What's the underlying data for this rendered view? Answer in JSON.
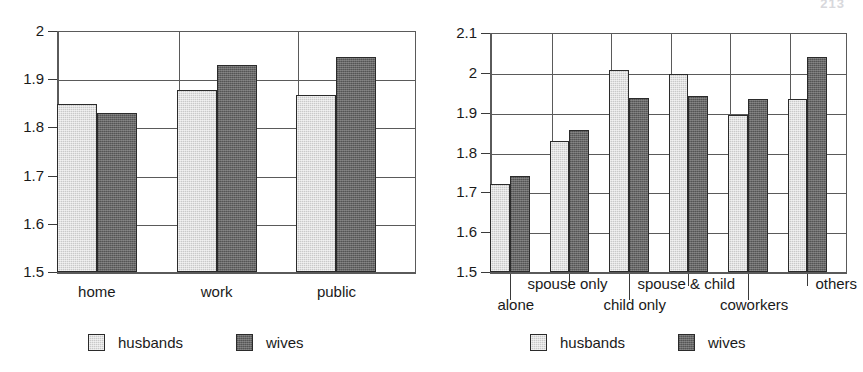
{
  "page": {
    "header_artifact": "213",
    "background_color": "#ffffff"
  },
  "colors": {
    "husbands": "#c9c9c9",
    "wives": "#676767",
    "axis": "#5a5a5a",
    "text": "#1a1a1a"
  },
  "legend": {
    "husbands_label": "husbands",
    "wives_label": "wives"
  },
  "chart_data": [
    {
      "id": "left",
      "type": "bar",
      "title": "",
      "xlabel": "",
      "ylabel": "",
      "ylim": [
        1.5,
        2.0
      ],
      "yticks": [
        "1.5",
        "1.6",
        "1.7",
        "1.8",
        "1.9",
        "2"
      ],
      "ytick_values": [
        1.5,
        1.6,
        1.7,
        1.8,
        1.9,
        2.0
      ],
      "grid": true,
      "legend_position": "bottom",
      "categories": [
        "home",
        "work",
        "public"
      ],
      "series": [
        {
          "name": "husbands",
          "values": [
            1.848,
            1.878,
            1.868
          ]
        },
        {
          "name": "wives",
          "values": [
            1.829,
            1.929,
            1.946
          ]
        }
      ]
    },
    {
      "id": "right",
      "type": "bar",
      "title": "",
      "xlabel": "",
      "ylabel": "",
      "ylim": [
        1.5,
        2.1
      ],
      "yticks": [
        "1.5",
        "1.6",
        "1.7",
        "1.8",
        "1.9",
        "2",
        "2.1"
      ],
      "ytick_values": [
        1.5,
        1.6,
        1.7,
        1.8,
        1.9,
        2.0,
        2.1
      ],
      "grid": true,
      "legend_position": "bottom",
      "categories": [
        "alone",
        "spouse only",
        "child only",
        "spouse & child",
        "coworkers",
        "others"
      ],
      "series": [
        {
          "name": "husbands",
          "values": [
            1.72,
            1.829,
            2.006,
            1.996,
            1.893,
            1.935
          ]
        },
        {
          "name": "wives",
          "values": [
            1.741,
            1.856,
            1.938,
            1.943,
            1.935,
            2.041
          ]
        }
      ]
    }
  ]
}
